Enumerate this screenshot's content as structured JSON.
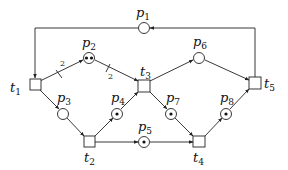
{
  "diagram": {
    "type": "petri-net",
    "places": [
      {
        "id": "p1",
        "label": "p",
        "sub": "1",
        "tokens": 0
      },
      {
        "id": "p2",
        "label": "p",
        "sub": "2",
        "tokens": 2
      },
      {
        "id": "p3",
        "label": "p",
        "sub": "3",
        "tokens": 0
      },
      {
        "id": "p4",
        "label": "p",
        "sub": "4",
        "tokens": 1
      },
      {
        "id": "p5",
        "label": "p",
        "sub": "5",
        "tokens": 1
      },
      {
        "id": "p6",
        "label": "p",
        "sub": "6",
        "tokens": 0
      },
      {
        "id": "p7",
        "label": "p",
        "sub": "7",
        "tokens": 1
      },
      {
        "id": "p8",
        "label": "p",
        "sub": "8",
        "tokens": 1
      }
    ],
    "transitions": [
      {
        "id": "t1",
        "label": "t",
        "sub": "1"
      },
      {
        "id": "t2",
        "label": "t",
        "sub": "2"
      },
      {
        "id": "t3",
        "label": "t",
        "sub": "3"
      },
      {
        "id": "t4",
        "label": "t",
        "sub": "4"
      },
      {
        "id": "t5",
        "label": "t",
        "sub": "5"
      }
    ],
    "arcs": [
      {
        "from": "p1",
        "to": "t1",
        "weight": 1
      },
      {
        "from": "t1",
        "to": "p2",
        "weight": 2,
        "weight_label": "2"
      },
      {
        "from": "p2",
        "to": "t3",
        "weight": 2,
        "weight_label": "2"
      },
      {
        "from": "t1",
        "to": "p3",
        "weight": 1
      },
      {
        "from": "p3",
        "to": "t2",
        "weight": 1
      },
      {
        "from": "t2",
        "to": "p4",
        "weight": 1
      },
      {
        "from": "p4",
        "to": "t3",
        "weight": 1
      },
      {
        "from": "t2",
        "to": "p5",
        "weight": 1
      },
      {
        "from": "p5",
        "to": "t4",
        "weight": 1
      },
      {
        "from": "t3",
        "to": "p6",
        "weight": 1
      },
      {
        "from": "t3",
        "to": "p7",
        "weight": 1
      },
      {
        "from": "p7",
        "to": "t4",
        "weight": 1
      },
      {
        "from": "t4",
        "to": "p8",
        "weight": 1
      },
      {
        "from": "p6",
        "to": "t5",
        "weight": 1
      },
      {
        "from": "p8",
        "to": "t5",
        "weight": 1
      },
      {
        "from": "t5",
        "to": "p1",
        "weight": 1
      }
    ]
  }
}
